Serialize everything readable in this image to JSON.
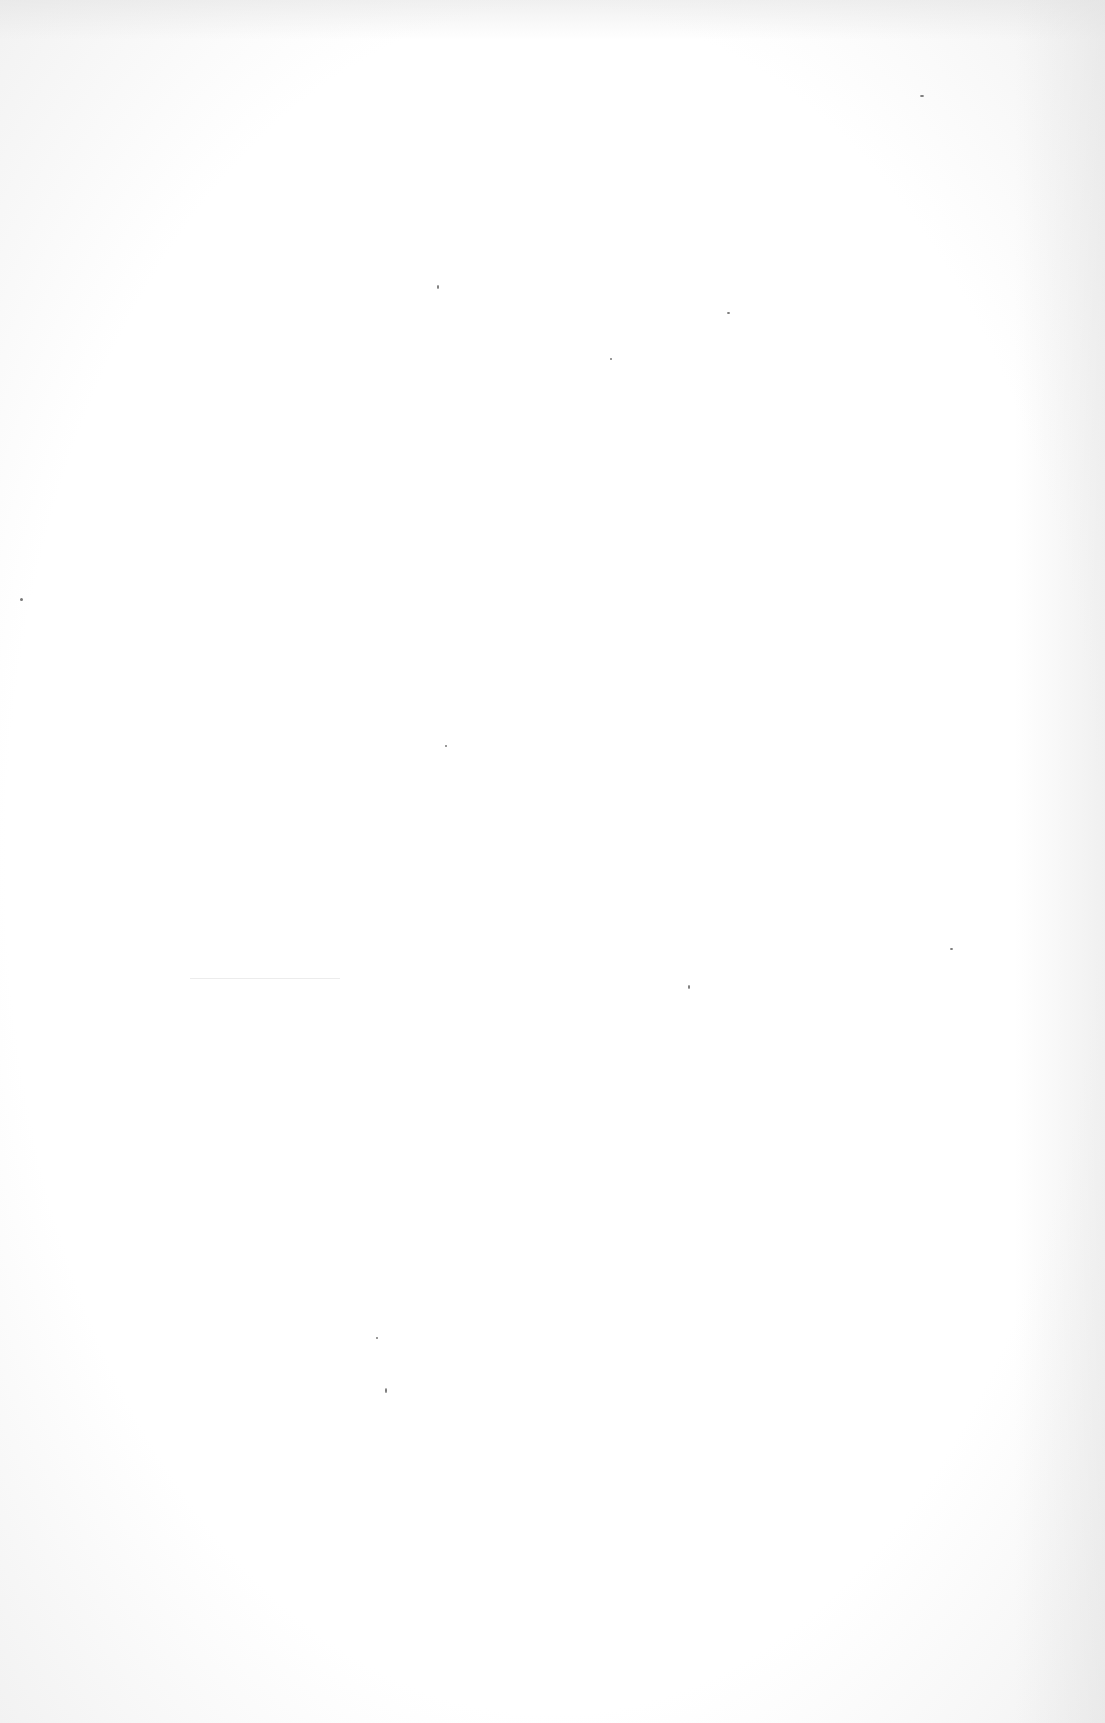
{
  "document": {
    "type": "blank scanned page",
    "text": ""
  }
}
